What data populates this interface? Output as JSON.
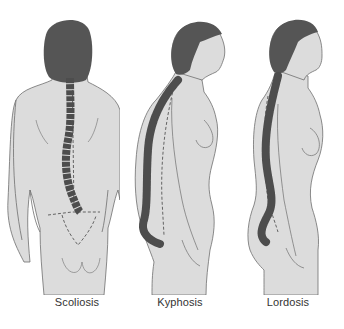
{
  "colors": {
    "skin": "#dcdcdc",
    "outline": "#6e6e6e",
    "hair": "#555555",
    "spine": "#4d4d4d",
    "label": "#333333",
    "background": "#ffffff"
  },
  "figures": [
    {
      "id": "scoliosis",
      "label": "Scoliosis",
      "view": "back"
    },
    {
      "id": "kyphosis",
      "label": "Kyphosis",
      "view": "side"
    },
    {
      "id": "lordosis",
      "label": "Lordosis",
      "view": "side"
    }
  ]
}
